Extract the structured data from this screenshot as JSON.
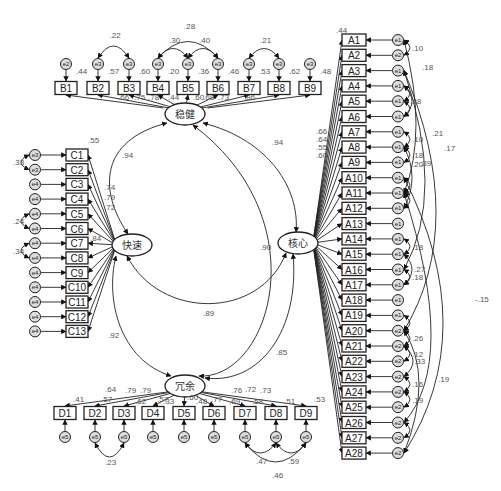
{
  "diagram": {
    "type": "structural-equation-model",
    "latents": [
      {
        "id": "stable",
        "label": "稳健",
        "x": 185,
        "y": 114
      },
      {
        "id": "fast",
        "label": "快速",
        "x": 132,
        "y": 245
      },
      {
        "id": "core",
        "label": "核心",
        "x": 298,
        "y": 243
      },
      {
        "id": "redundant",
        "label": "冗余",
        "x": 185,
        "y": 386
      }
    ],
    "latent_correlations": [
      {
        "from": "stable",
        "to": "fast",
        "value": ".94"
      },
      {
        "from": "stable",
        "to": "core",
        "value": ".94"
      },
      {
        "from": "stable",
        "to": "redundant",
        "value": ".90"
      },
      {
        "from": "fast",
        "to": "core",
        "value": ".89"
      },
      {
        "from": "fast",
        "to": "redundant",
        "value": ".92"
      },
      {
        "from": "core",
        "to": "redundant",
        "value": ".85"
      }
    ],
    "groups": {
      "B": {
        "latent": "稳健",
        "indicators": [
          "B1",
          "B2",
          "B3",
          "B4",
          "B5",
          "B6",
          "B7",
          "B8",
          "B9"
        ],
        "r2": [
          ".44",
          ".57",
          ".60",
          ".20",
          ".36",
          ".46",
          ".53",
          ".62",
          ".48"
        ],
        "loadings": [
          "",
          ".66",
          ".75",
          ".78",
          ".44",
          ".60",
          ".68",
          ".73",
          ".86"
        ],
        "errors": [
          "e2",
          "e3",
          "e3",
          "e3",
          "e3",
          "e3",
          "e3",
          "e3",
          "e3"
        ],
        "covariances": [
          {
            "a": 1,
            "b": 2,
            "value": ".22"
          },
          {
            "a": 3,
            "b": 4,
            "value": ".30"
          },
          {
            "a": 4,
            "b": 5,
            "value": ".40"
          },
          {
            "a": 3,
            "b": 5,
            "value": ".28"
          },
          {
            "a": 6,
            "b": 7,
            "value": ".21"
          }
        ]
      },
      "C": {
        "latent": "快速",
        "indicators": [
          "C1",
          "C2",
          "C3",
          "C4",
          "C5",
          "C6",
          "C7",
          "C8",
          "C9",
          "C10",
          "C11",
          "C12",
          "C13"
        ],
        "r2": [
          ".55"
        ],
        "loadings": [
          ".74",
          ".79",
          ".72"
        ],
        "errors": [
          "e3",
          "e3",
          "e4",
          "e4",
          "e4",
          "e4",
          "e4",
          "e4",
          "e4",
          "e4",
          "e4",
          "e4",
          "e4"
        ],
        "covariances": [
          {
            "a": 0,
            "b": 1,
            "value": ".33"
          },
          {
            "a": 4,
            "b": 5,
            "value": ".24"
          },
          {
            "a": 6,
            "b": 7,
            "value": ".34"
          }
        ],
        "extra_labels": [
          ".84"
        ]
      },
      "D": {
        "latent": "冗余",
        "indicators": [
          "D1",
          "D2",
          "D3",
          "D4",
          "D5",
          "D6",
          "D7",
          "D8",
          "D9"
        ],
        "r2_labels": [
          ".41",
          ".57",
          ".62",
          ".57",
          ".33",
          ".60",
          ".48",
          ".77",
          ".69",
          ".58",
          ".51",
          ".53"
        ],
        "loadings": [
          ".64",
          ".79",
          ".79",
          ".78",
          ".72",
          ".73"
        ],
        "errors": [
          "e5",
          "e5",
          "e5",
          "e5",
          "e5",
          "e5",
          "e5",
          "e5",
          "e5"
        ],
        "covariances": [
          {
            "a": 1,
            "b": 2,
            "value": ".23"
          },
          {
            "a": 6,
            "b": 7,
            "value": ".47"
          },
          {
            "a": 7,
            "b": 8,
            "value": ".59"
          },
          {
            "a": 6,
            "b": 8,
            "value": ".46"
          }
        ]
      },
      "A": {
        "latent": "核心",
        "indicators": [
          "A1",
          "A2",
          "A3",
          "A4",
          "A5",
          "A6",
          "A7",
          "A8",
          "A9",
          "A10",
          "A11",
          "A12",
          "A13",
          "A14",
          "A15",
          "A16",
          "A17",
          "A18",
          "A19",
          "A20",
          "A21",
          "A22",
          "A23",
          "A24",
          "A25",
          "A26",
          "A27",
          "A28"
        ],
        "r2": [
          ".44"
        ],
        "loadings": [
          ".66",
          ".64",
          ".55",
          ".60"
        ],
        "errors": [
          "e1",
          "e2",
          "e1",
          "e1",
          "e1",
          "e1",
          "e1",
          "e1",
          "e1",
          "e1",
          "e1",
          "e1",
          "e1",
          "e1",
          "e1",
          "e1",
          "e1",
          "e1",
          "e1",
          "e2",
          "e2",
          "e2",
          "e2",
          "e2",
          "e2",
          "e2",
          "e2",
          "e2"
        ],
        "covariance_labels": [
          ".10",
          ".18",
          ".28",
          ".21",
          ".17",
          ".10",
          ".18",
          ".20",
          ".39",
          ".18",
          ".27",
          ".18",
          ".26",
          ".33",
          ".12",
          ".16",
          ".19",
          ".-15"
        ]
      }
    }
  }
}
